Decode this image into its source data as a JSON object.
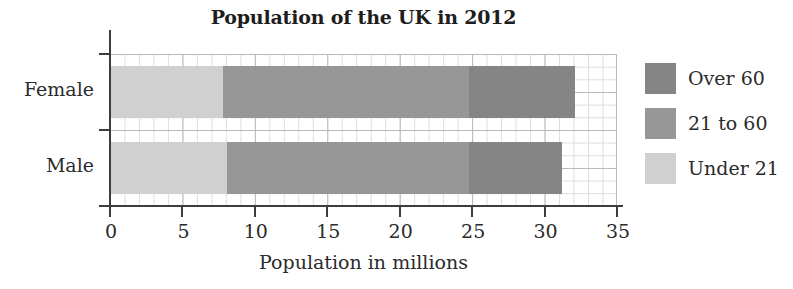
{
  "chart_data": {
    "type": "bar",
    "orientation": "horizontal",
    "stacked": true,
    "title": "Population of the UK in 2012",
    "xlabel": "Population in millions",
    "ylabel": "",
    "categories": [
      "Female",
      "Male"
    ],
    "xlim": [
      0,
      35
    ],
    "xticks": [
      0,
      5,
      10,
      15,
      20,
      25,
      30,
      35
    ],
    "xtick_labels": [
      "0",
      "5",
      "10",
      "15",
      "20",
      "25",
      "30",
      "35"
    ],
    "grid": true,
    "grid_style": "graph-paper minor and major gridlines",
    "legend_position": "right",
    "series": [
      {
        "name": "Under 21",
        "color": "#d0d0d0",
        "values": [
          7.8,
          8.1
        ]
      },
      {
        "name": "21 to 60",
        "color": "#979797",
        "values": [
          17.0,
          16.7
        ]
      },
      {
        "name": "Over 60",
        "color": "#858585",
        "values": [
          7.3,
          6.4
        ]
      }
    ],
    "segment_boundaries": {
      "Female": [
        0,
        7.8,
        24.8,
        32.1
      ],
      "Male": [
        0,
        8.1,
        24.8,
        31.2
      ]
    },
    "totals": [
      32.1,
      31.2
    ],
    "legend": [
      {
        "label": "Over 60",
        "color": "#858585"
      },
      {
        "label": "21 to 60",
        "color": "#979797"
      },
      {
        "label": "Under 21",
        "color": "#d0d0d0"
      }
    ]
  },
  "colors": {
    "axis": "#3d3d3d",
    "grid_minor": "#dedede",
    "grid_major": "#b9b9b9",
    "text": "#2b2b2b",
    "title": "#1d1d1d",
    "background": "#ffffff"
  }
}
